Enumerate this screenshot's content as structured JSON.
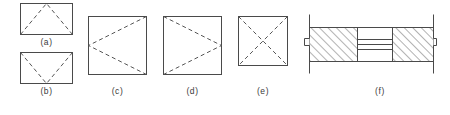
{
  "sheet": {
    "width": 450,
    "height": 115,
    "background": "#ffffff",
    "line_color": "#4a4a4a",
    "dash_color": "#555555",
    "hatch_color": "#555555",
    "caption_color": "#3a3a3a"
  },
  "figures": [
    {
      "id": "a",
      "caption": "(a)",
      "shape": "rectangle",
      "description": "rectangle with dashed lines from both bottom corners meeting at apex on top edge midpoint",
      "x": 20,
      "y": 3,
      "w": 53,
      "h": 32,
      "dashed_kind": "peak",
      "caption_x": 20,
      "caption_y": 38,
      "caption_w": 53
    },
    {
      "id": "b",
      "caption": "(b)",
      "shape": "rectangle",
      "description": "rectangle with dashed lines from both top corners meeting at valley on bottom edge midpoint",
      "x": 20,
      "y": 52,
      "w": 53,
      "h": 32,
      "dashed_kind": "valley",
      "caption_x": 20,
      "caption_y": 87,
      "caption_w": 53
    },
    {
      "id": "c",
      "caption": "(c)",
      "shape": "square",
      "description": "square with dashed lines from top-right and bottom-right corners meeting at left edge midpoint",
      "x": 88,
      "y": 16,
      "w": 59,
      "h": 59,
      "dashed_kind": "left-vertex",
      "caption_x": 88,
      "caption_y": 87,
      "caption_w": 59
    },
    {
      "id": "d",
      "caption": "(d)",
      "shape": "square",
      "description": "square with dashed lines from top-left and bottom-left corners meeting at right edge midpoint",
      "x": 163,
      "y": 16,
      "w": 59,
      "h": 59,
      "dashed_kind": "right-vertex",
      "caption_x": 163,
      "caption_y": 87,
      "caption_w": 59
    },
    {
      "id": "e",
      "caption": "(e)",
      "shape": "square",
      "description": "square with both dashed diagonals forming an X",
      "x": 238,
      "y": 16,
      "w": 50,
      "h": 50,
      "dashed_kind": "cross",
      "caption_x": 238,
      "caption_y": 87,
      "caption_w": 50
    },
    {
      "id": "f",
      "caption": "(f)",
      "shape": "section-view",
      "description": "sectional view: hatched blocks at left and right ends, plain middle region with horizontal lines, vertical extension lines beyond top and bottom",
      "x": 305,
      "y": 14,
      "w": 132,
      "h": 52,
      "dashed_kind": "none",
      "caption_x": 340,
      "caption_y": 87,
      "caption_w": 80,
      "section": {
        "body_top": 27,
        "body_bottom": 61,
        "left_edge": 309,
        "right_edge": 433,
        "left_block_right": 357,
        "right_block_left": 392,
        "extension_top": 14,
        "extension_bottom": 72,
        "hatch_direction": "forward-slash",
        "hatch_spacing": 6,
        "middle_lines": 3,
        "step_notch": "both-ends"
      }
    }
  ]
}
